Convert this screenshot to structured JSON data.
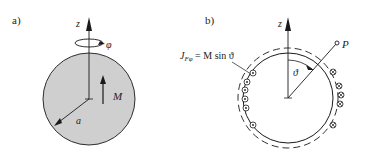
{
  "panel_a": {
    "label": "a)",
    "axis_label": "z",
    "rotation_label": "φ",
    "magnetization_label": "M",
    "radius_label": "a",
    "sphere_fill": "#cfcfcf"
  },
  "panel_b": {
    "label": "b)",
    "axis_label": "z",
    "point_label": "P",
    "angle_label": "ϑ",
    "current_label_lhs": "J",
    "current_label_sub": "Fφ",
    "current_label_rhs": " = M sin ϑ",
    "left_markers": [
      "dot",
      "dot",
      "dot",
      "dot",
      "dot",
      "dot"
    ],
    "right_markers": [
      "cross",
      "cross",
      "cross",
      "cross",
      "cross"
    ]
  },
  "colors": {
    "stroke": "#1a1a1a",
    "sphere_fill": "#cfcfcf",
    "background": "#ffffff"
  }
}
